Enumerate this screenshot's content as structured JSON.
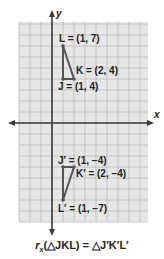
{
  "diagram": {
    "type": "coordinate-plane-reflection",
    "axes": {
      "x_label": "x",
      "y_label": "y"
    },
    "grid": {
      "unit_px": 11,
      "origin_px": [
        52,
        123
      ],
      "left": 19,
      "right": 148,
      "top": 22,
      "bottom": 222,
      "color": "#bdbdbd",
      "background": "#e6e6e6"
    },
    "triangle_original": {
      "vertices": [
        {
          "name": "L",
          "coords": [
            1,
            7
          ],
          "label": "L = (1, 7)"
        },
        {
          "name": "K",
          "coords": [
            2,
            4
          ],
          "label": "K = (2, 4)"
        },
        {
          "name": "J",
          "coords": [
            1,
            4
          ],
          "label": "J = (1, 4)"
        }
      ]
    },
    "triangle_image": {
      "vertices": [
        {
          "name": "J'",
          "coords": [
            1,
            -4
          ],
          "label": "J′ = (1, −4)"
        },
        {
          "name": "K'",
          "coords": [
            2,
            -4
          ],
          "label": "K′ = (2, −4)"
        },
        {
          "name": "L'",
          "coords": [
            1,
            -7
          ],
          "label": "L′ = (1, −7)"
        }
      ]
    },
    "caption": {
      "func": "r",
      "subscript": "x",
      "arg": "(△JKL)",
      "equals": " = ",
      "result": "△J′K′L′"
    },
    "colors": {
      "line": "#555555",
      "axis": "#3a3a3a",
      "text": "#222222"
    }
  }
}
